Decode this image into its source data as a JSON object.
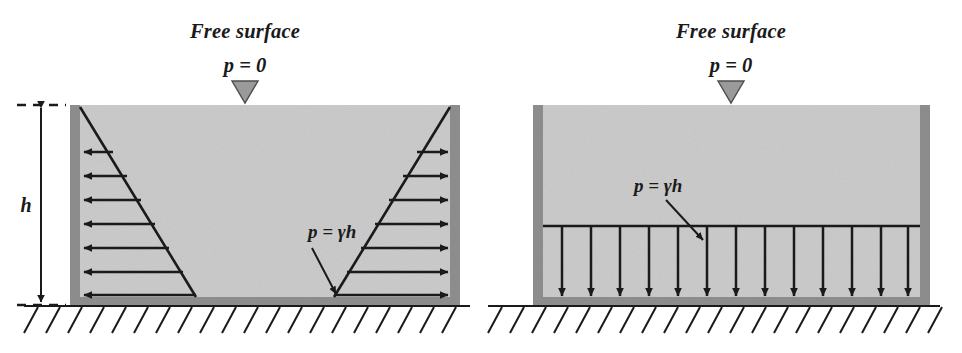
{
  "figure": {
    "panels": [
      {
        "id": "left-panel",
        "name": "lateral-pressure-on-walls",
        "free_surface_label": "Free surface",
        "surface_pressure_label": "p = 0",
        "depth_label": "h",
        "base_pressure_label": "p = γh",
        "pressure_profile": "triangular",
        "arrow_direction": "horizontal-outward",
        "arrow_count_left_wall": 7,
        "arrow_count_right_wall": 7,
        "dimension_line": "h"
      },
      {
        "id": "right-panel",
        "name": "uniform-pressure-on-base",
        "free_surface_label": "Free surface",
        "surface_pressure_label": "p = 0",
        "base_pressure_label": "p = γh",
        "pressure_profile": "uniform",
        "arrow_direction": "downward",
        "arrow_count_base": 13
      }
    ],
    "symbols": {
      "free_surface_marker": "inverted-triangle",
      "ground_support": "hatched-ground"
    },
    "colors": {
      "fluid_fill": "#c9c9c9",
      "wall": "#8c8c8c",
      "line": "#1a1a1a",
      "marker_fill": "#9a9a9a",
      "background": "#ffffff"
    }
  }
}
